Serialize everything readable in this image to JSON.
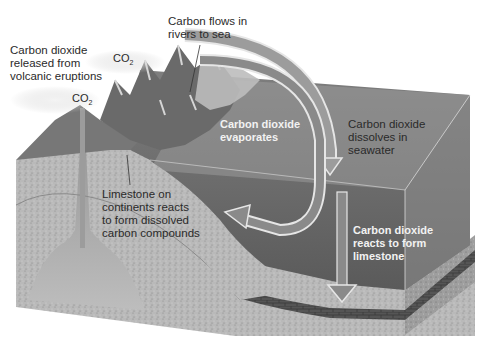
{
  "diagram": {
    "style": "grayscale 3D block diagram",
    "colors": {
      "background": "#ffffff",
      "sky_water_box": "#a9a9a9",
      "ocean_surface": "#7a7a7a",
      "ocean_deep": "#5e5e5e",
      "bedrock": "#b7b7b7",
      "magma": "#9a9a9a",
      "arrow_fill": "#9c9c9c",
      "arrow_outline": "#e6e6e6",
      "mountains": "#6a6a6a",
      "limestone_layer": "#4a4a4a"
    },
    "labels": {
      "volcanic": "Carbon dioxide\nreleased from\nvolcanic eruptions",
      "rivers": "Carbon flows in\nrivers to sea",
      "evaporates": "Carbon dioxide\nevaporates",
      "dissolves": "Carbon dioxide\ndissolves in\nseawater",
      "limestone_continents": "Limestone on\ncontinents reacts\nto form dissolved\ncarbon compounds",
      "reacts": "Carbon dioxide\nreacts to form\nlimestone"
    },
    "co2_tags": [
      {
        "base": "CO",
        "sub": "2"
      },
      {
        "base": "CO",
        "sub": "2"
      }
    ],
    "nodes": [
      "volcano",
      "mountains",
      "river",
      "ocean",
      "sea floor limestone layer",
      "magma chamber",
      "bedrock"
    ],
    "edges": [
      {
        "from": "volcano",
        "to": "atmosphere",
        "label": "Carbon dioxide released from volcanic eruptions"
      },
      {
        "from": "land",
        "to": "ocean",
        "label": "Carbon flows in rivers to sea"
      },
      {
        "from": "atmosphere",
        "to": "ocean",
        "label": "Carbon dioxide dissolves in seawater"
      },
      {
        "from": "ocean",
        "to": "atmosphere",
        "label": "Carbon dioxide evaporates"
      },
      {
        "from": "ocean",
        "to": "sea floor",
        "label": "Carbon dioxide reacts to form limestone"
      },
      {
        "from": "continental limestone",
        "to": "ocean",
        "label": "Limestone on continents reacts to form dissolved carbon compounds"
      }
    ]
  }
}
